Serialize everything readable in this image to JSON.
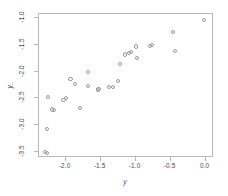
{
  "chart_data": {
    "type": "scatter",
    "title": "",
    "xlabel": "y",
    "ylabel": "y_",
    "xlim": [
      -2.38,
      0.12
    ],
    "ylim": [
      -3.62,
      -0.92
    ],
    "xticks": [
      -2.0,
      -1.5,
      -1.0,
      -0.5,
      0.0
    ],
    "xticklabels": [
      "-2.0",
      "-1.5",
      "-1.0",
      "-0.5",
      "0.0"
    ],
    "yticks": [
      -1.0,
      -1.5,
      -2.0,
      -2.5,
      -3.0,
      -3.5
    ],
    "yticklabels": [
      "-1.0",
      "-1.5",
      "-2.0",
      "-2.5",
      "-3.0",
      "-3.5"
    ],
    "grid": false,
    "legend": null,
    "marker": "open-circle",
    "marker_color": "#9a9a9a",
    "frame_color": "#b9b9b9",
    "points": [
      {
        "x": -2.3,
        "y": -3.5
      },
      {
        "x": -2.26,
        "y": -3.53
      },
      {
        "x": -2.27,
        "y": -3.07
      },
      {
        "x": -2.25,
        "y": -2.48
      },
      {
        "x": -2.2,
        "y": -2.71
      },
      {
        "x": -2.16,
        "y": -2.72
      },
      {
        "x": -2.03,
        "y": -2.53
      },
      {
        "x": -2.0,
        "y": -2.5
      },
      {
        "x": -1.93,
        "y": -2.14
      },
      {
        "x": -1.87,
        "y": -2.24
      },
      {
        "x": -1.8,
        "y": -2.69
      },
      {
        "x": -1.68,
        "y": -2.0
      },
      {
        "x": -1.68,
        "y": -2.27
      },
      {
        "x": -1.54,
        "y": -2.35
      },
      {
        "x": -1.53,
        "y": -2.33
      },
      {
        "x": -1.38,
        "y": -2.29
      },
      {
        "x": -1.32,
        "y": -2.29
      },
      {
        "x": -1.25,
        "y": -2.18
      },
      {
        "x": -1.22,
        "y": -1.85
      },
      {
        "x": -1.15,
        "y": -1.68
      },
      {
        "x": -1.1,
        "y": -1.65
      },
      {
        "x": -1.07,
        "y": -1.63
      },
      {
        "x": -1.0,
        "y": -1.53
      },
      {
        "x": -0.98,
        "y": -1.75
      },
      {
        "x": -0.8,
        "y": -1.52
      },
      {
        "x": -0.76,
        "y": -1.5
      },
      {
        "x": -0.47,
        "y": -1.25
      },
      {
        "x": -0.44,
        "y": -1.62
      },
      {
        "x": -0.02,
        "y": -1.03
      }
    ]
  }
}
